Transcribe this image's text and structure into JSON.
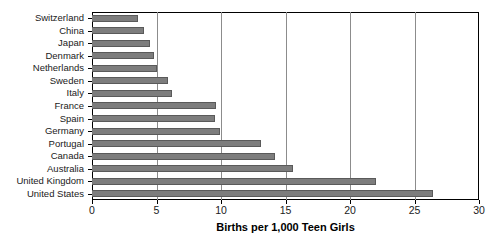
{
  "chart_data": {
    "type": "bar",
    "orientation": "horizontal",
    "title": "",
    "xlabel": "Births per 1,000 Teen Girls",
    "ylabel": "",
    "xlim": [
      0,
      30
    ],
    "xticks": [
      0,
      5,
      10,
      15,
      20,
      25,
      30
    ],
    "grid": true,
    "grid_axis": "x",
    "legend": false,
    "bar_color": "#7d7d7d",
    "bar_border_color": "#5a5a5a",
    "categories": [
      "Switzerland",
      "China",
      "Japan",
      "Denmark",
      "Netherlands",
      "Sweden",
      "Italy",
      "France",
      "Spain",
      "Germany",
      "Portugal",
      "Canada",
      "Australia",
      "United Kingdom",
      "United States"
    ],
    "values": [
      3.6,
      4.0,
      4.5,
      4.8,
      5.0,
      5.9,
      6.2,
      9.6,
      9.5,
      9.9,
      13.1,
      14.2,
      15.6,
      22.0,
      26.4
    ],
    "series": [
      {
        "name": "Births per 1,000 Teen Girls",
        "values": [
          3.6,
          4.0,
          4.5,
          4.8,
          5.0,
          5.9,
          6.2,
          9.6,
          9.5,
          9.9,
          13.1,
          14.2,
          15.6,
          22.0,
          26.4
        ]
      }
    ]
  },
  "axis": {
    "x_title": "Births per 1,000 Teen Girls",
    "tick_labels": [
      "0",
      "5",
      "10",
      "15",
      "20",
      "25",
      "30"
    ]
  }
}
